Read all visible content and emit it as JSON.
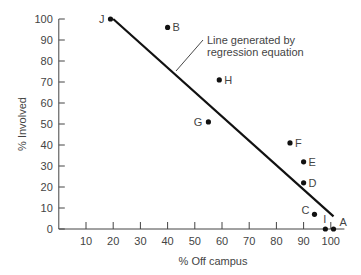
{
  "chart_data": {
    "type": "scatter",
    "title": "",
    "xlabel": "% Off campus",
    "ylabel": "% Involved",
    "xlim": [
      0,
      105
    ],
    "ylim": [
      0,
      100
    ],
    "x_ticks": [
      10,
      20,
      30,
      40,
      50,
      60,
      70,
      80,
      90,
      100
    ],
    "y_ticks": [
      0,
      10,
      20,
      30,
      40,
      50,
      60,
      70,
      80,
      90,
      100
    ],
    "grid": false,
    "points": [
      {
        "label": "J",
        "x": 19,
        "y": 100
      },
      {
        "label": "B",
        "x": 40,
        "y": 96
      },
      {
        "label": "H",
        "x": 59,
        "y": 71
      },
      {
        "label": "G",
        "x": 55,
        "y": 51
      },
      {
        "label": "F",
        "x": 85,
        "y": 41
      },
      {
        "label": "E",
        "x": 90,
        "y": 32
      },
      {
        "label": "D",
        "x": 90,
        "y": 22
      },
      {
        "label": "C",
        "x": 94,
        "y": 7
      },
      {
        "label": "I",
        "x": 98,
        "y": 0
      },
      {
        "label": "A",
        "x": 101,
        "y": 0
      }
    ],
    "regression_line": {
      "x1": 20,
      "y1": 100,
      "x2": 101,
      "y2": 6
    },
    "annotation": {
      "line1": "Line generated by",
      "line2": "regression equation"
    }
  }
}
